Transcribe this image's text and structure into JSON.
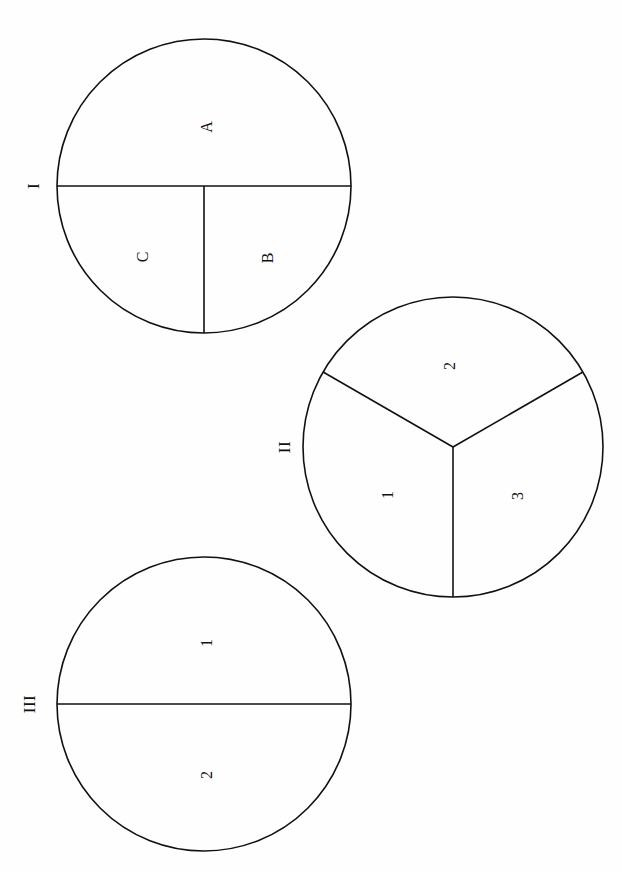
{
  "page": {
    "header_fragment": "",
    "background_color": "#fefefe",
    "ink_color": "#111111",
    "width": 622,
    "height": 872
  },
  "figure": {
    "title": "",
    "stroke_color": "#111111",
    "stroke_width": 1.6,
    "circles": [
      {
        "id": "circle-1",
        "numeral": "I",
        "numeral_x": 33,
        "numeral_y": 186,
        "center_x": 204,
        "center_y": 186,
        "radius": 147,
        "division": "half-plus-two-quarters",
        "regions": [
          {
            "label": "A",
            "x": 207,
            "y": 127
          },
          {
            "label": "C",
            "x": 143,
            "y": 257
          },
          {
            "label": "B",
            "x": 268,
            "y": 258
          }
        ]
      },
      {
        "id": "circle-2",
        "numeral": "II",
        "numeral_x": 284,
        "numeral_y": 447,
        "center_x": 453,
        "center_y": 447,
        "radius": 150,
        "division": "three-equal-sectors",
        "regions": [
          {
            "label": "2",
            "x": 450,
            "y": 366
          },
          {
            "label": "1",
            "x": 388,
            "y": 495
          },
          {
            "label": "3",
            "x": 518,
            "y": 496
          }
        ]
      },
      {
        "id": "circle-3",
        "numeral": "III",
        "numeral_x": 29,
        "numeral_y": 704,
        "center_x": 204,
        "center_y": 704,
        "radius": 147,
        "division": "two-halves",
        "regions": [
          {
            "label": "1",
            "x": 207,
            "y": 643
          },
          {
            "label": "2",
            "x": 207,
            "y": 775
          }
        ]
      }
    ]
  }
}
